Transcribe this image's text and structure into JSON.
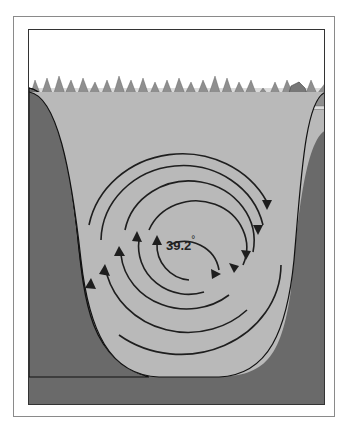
{
  "figure": {
    "temperature_label": "39.2",
    "temperature_unit": "°",
    "colors": {
      "sky": "#ffffff",
      "ground": "#6a6a6a",
      "water": "#b9b9b9",
      "shore_ice": "#dcdcdc",
      "arrows": "#1e1e1e",
      "trees": "#8c8c8c",
      "house": "#777777"
    }
  }
}
